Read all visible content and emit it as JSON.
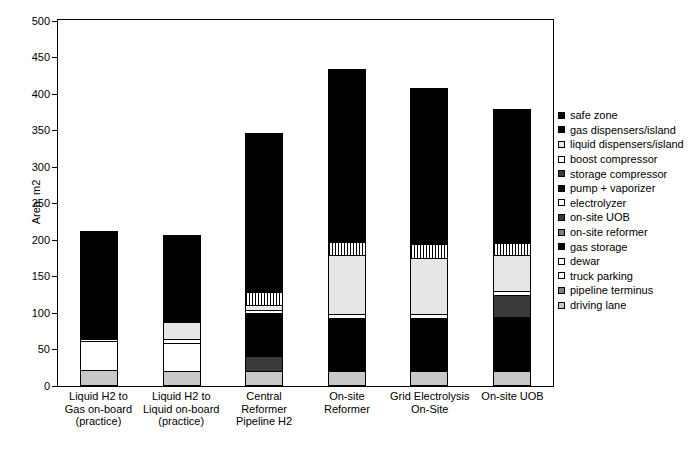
{
  "chart_data": {
    "type": "bar",
    "subtype": "stacked-bar",
    "title": "",
    "xlabel": "",
    "ylabel": "Area, m2",
    "ylim": [
      0,
      500
    ],
    "ytick_step": 50,
    "yticks": [
      0,
      50,
      100,
      150,
      200,
      250,
      300,
      350,
      400,
      450,
      500
    ],
    "grid": false,
    "legend_position": "right",
    "categories": [
      "Liquid H2 to\nGas on-board\n(practice)",
      "Liquid H2 to\nLiquid on-board\n(practice)",
      "Central\nReformer\nPipeline H2",
      "On-site\nReformer",
      "Grid Electrolysis\nOn-Site",
      "On-site UOB"
    ],
    "category_lines": [
      [
        "Liquid H2 to",
        "Gas on-board",
        "(practice)"
      ],
      [
        "Liquid H2 to",
        "Liquid on-board",
        "(practice)"
      ],
      [
        "Central",
        "Reformer",
        "Pipeline H2"
      ],
      [
        "On-site",
        "Reformer"
      ],
      [
        "Grid Electrolysis",
        "On-Site"
      ],
      [
        "On-site UOB"
      ]
    ],
    "totals": [
      213,
      207,
      347,
      434,
      408,
      379
    ],
    "series": [
      {
        "name": "driving lane",
        "fill": "f-ltgray",
        "values": [
          22,
          21,
          20,
          20,
          21,
          20
        ]
      },
      {
        "name": "pipeline terminus",
        "fill": "f-dkgray",
        "values": [
          0,
          0,
          21,
          0,
          0,
          0
        ]
      },
      {
        "name": "truck parking",
        "fill": "f-white",
        "values": [
          39,
          38,
          0,
          0,
          0,
          0
        ]
      },
      {
        "name": "dewar",
        "fill": "f-white",
        "values": [
          4,
          5,
          0,
          0,
          0,
          0
        ]
      },
      {
        "name": "gas storage",
        "fill": "f-black",
        "values": [
          10,
          0,
          0,
          0,
          0,
          0
        ]
      },
      {
        "name": "on-site reformer",
        "fill": "f-dkgray",
        "values": [
          0,
          0,
          0,
          0,
          0,
          0
        ]
      },
      {
        "name": "on-site UOB",
        "fill": "f-mdgray",
        "values": [
          0,
          0,
          0,
          0,
          0,
          0
        ]
      },
      {
        "name": "electrolyzer",
        "fill": "f-vltgray",
        "values": [
          0,
          24,
          0,
          0,
          0,
          0
        ]
      },
      {
        "name": "pump + vaporizer",
        "fill": "f-black",
        "values": [
          18,
          0,
          59,
          73,
          72,
          75
        ]
      },
      {
        "name": "storage compressor",
        "fill": "f-dkgray",
        "values": [
          0,
          0,
          0,
          0,
          0,
          30
        ]
      },
      {
        "name": "boost compressor",
        "fill": "f-white",
        "values": [
          0,
          0,
          4,
          5,
          5,
          5
        ]
      },
      {
        "name": "liquid dispensers/island",
        "fill": "f-vltgray",
        "values": [
          0,
          0,
          7,
          82,
          78,
          50
        ]
      },
      {
        "name": "gas dispensers/island",
        "fill": "f-hatchv",
        "values": [
          0,
          0,
          18,
          17,
          18,
          16
        ]
      },
      {
        "name": "safe zone",
        "fill": "f-black",
        "values": [
          120,
          119,
          218,
          237,
          214,
          183
        ]
      }
    ]
  },
  "legend": {
    "items": [
      {
        "label": "safe zone",
        "fill": "f-black"
      },
      {
        "label": "gas dispensers/island",
        "fill": "f-black"
      },
      {
        "label": "liquid dispensers/island",
        "fill": "f-vltgray"
      },
      {
        "label": "boost compressor",
        "fill": "f-white"
      },
      {
        "label": "storage compressor",
        "fill": "f-dkgray"
      },
      {
        "label": "pump + vaporizer",
        "fill": "f-black"
      },
      {
        "label": "electrolyzer",
        "fill": "f-white"
      },
      {
        "label": "on-site UOB",
        "fill": "f-dkgray"
      },
      {
        "label": "on-site reformer",
        "fill": "f-mdgray"
      },
      {
        "label": "gas storage",
        "fill": "f-black"
      },
      {
        "label": "dewar",
        "fill": "f-white"
      },
      {
        "label": "truck parking",
        "fill": "f-white"
      },
      {
        "label": "pipeline terminus",
        "fill": "f-mdgray"
      },
      {
        "label": "driving lane",
        "fill": "f-ltgray"
      }
    ]
  }
}
